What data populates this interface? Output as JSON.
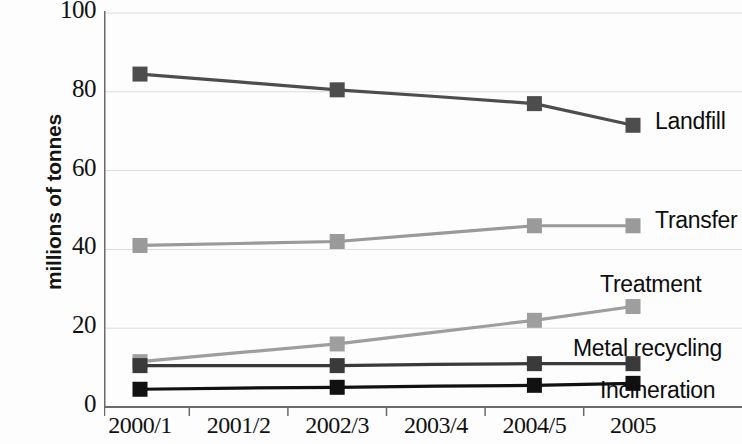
{
  "chart_data": {
    "type": "line",
    "title": "",
    "xlabel": "",
    "ylabel": "millions of tonnes",
    "categories": [
      "2000/1",
      "2001/2",
      "2002/3",
      "2003/4",
      "2004/5",
      "2005"
    ],
    "ylim": [
      0,
      100
    ],
    "yticks": [
      0,
      20,
      40,
      60,
      80,
      100
    ],
    "grid": true,
    "legend_position": "right-of-line-ends",
    "marker": "square",
    "marker_categories": [
      "2000/1",
      "2002/3",
      "2004/5",
      "2005"
    ],
    "series": [
      {
        "name": "Landfill",
        "color": "#4d4d4d",
        "values": [
          84.5,
          82.5,
          80.5,
          78.8,
          77.0,
          71.5
        ],
        "marker_values": [
          84.5,
          80.5,
          77.0,
          71.5
        ]
      },
      {
        "name": "Transfer",
        "color": "#9a9a9a",
        "values": [
          41.0,
          41.5,
          42.0,
          44.0,
          46.0,
          46.0
        ],
        "marker_values": [
          41.0,
          42.0,
          46.0,
          46.0
        ]
      },
      {
        "name": "Treatment",
        "color": "#9e9e9e",
        "values": [
          11.5,
          13.8,
          16.0,
          19.0,
          22.0,
          25.5
        ],
        "marker_values": [
          11.5,
          16.0,
          22.0,
          25.5
        ]
      },
      {
        "name": "Metal recycling",
        "color": "#3a3a3a",
        "values": [
          10.5,
          10.5,
          10.5,
          10.8,
          11.0,
          11.0
        ],
        "marker_values": [
          10.5,
          10.5,
          11.0,
          11.0
        ]
      },
      {
        "name": "Incineration",
        "color": "#111111",
        "values": [
          4.5,
          4.8,
          5.0,
          5.3,
          5.5,
          6.0
        ],
        "marker_values": [
          4.5,
          5.0,
          5.5,
          6.0
        ]
      }
    ]
  },
  "axis": {
    "y_title": "millions of tonnes",
    "y_labels": [
      "100",
      "80",
      "60",
      "40",
      "20",
      "0"
    ],
    "x_labels": [
      "2000/1",
      "2001/2",
      "2002/3",
      "2003/4",
      "2004/5",
      "2005"
    ]
  },
  "series_labels": {
    "landfill": "Landfill",
    "transfer": "Transfer",
    "treatment": "Treatment",
    "metal_recycling": "Metal recycling",
    "incineration": "Incineration"
  }
}
